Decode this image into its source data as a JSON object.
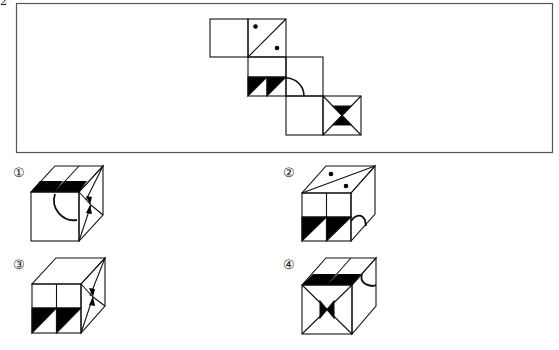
{
  "question": {
    "number_fragment": "2",
    "prompt_box": {
      "border_color": "#555555"
    },
    "net": {
      "description": "Unfolded cube net of six squares",
      "faces": [
        {
          "id": "face-blank",
          "pattern": "blank"
        },
        {
          "id": "face-dots",
          "pattern": "diagonal with two dots"
        },
        {
          "id": "face-triangles",
          "pattern": "two black triangles in bottom half"
        },
        {
          "id": "face-arc",
          "pattern": "quarter arc in bottom-left corner"
        },
        {
          "id": "face-blank-2",
          "pattern": "blank"
        },
        {
          "id": "face-hourglass",
          "pattern": "X diagonals with black hourglass"
        }
      ]
    }
  },
  "options": [
    {
      "label": "①",
      "description": "Cube with triangles on top, arc on front, hourglass on right"
    },
    {
      "label": "②",
      "description": "Cube with dots on top, triangles on front, arc on right"
    },
    {
      "label": "③",
      "description": "Cube with blank top, triangles on front, hourglass on right"
    },
    {
      "label": "④",
      "description": "Cube with triangles on top, hourglass on front, arc on right"
    }
  ],
  "colors": {
    "ink": "#111111",
    "fill": "#000000",
    "background": "#ffffff"
  }
}
